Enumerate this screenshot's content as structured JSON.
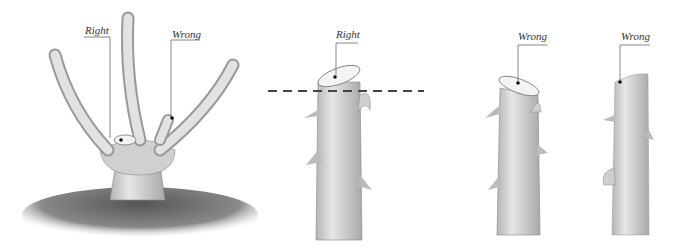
{
  "figure": {
    "panels": [
      {
        "id": "bush",
        "labels": [
          {
            "text": "Right"
          },
          {
            "text": "Wrong"
          }
        ]
      },
      {
        "id": "stem-right",
        "labels": [
          {
            "text": "Right"
          }
        ]
      },
      {
        "id": "stem-wrong-slanted",
        "labels": [
          {
            "text": "Wrong"
          }
        ]
      },
      {
        "id": "stem-wrong-flat",
        "labels": [
          {
            "text": "Wrong"
          }
        ]
      }
    ]
  },
  "colors": {
    "stem": "#d8d8d8",
    "stem_shade": "#a8a8a8",
    "soil": "#6a6a6a",
    "line": "#555555",
    "dash": "#444444"
  }
}
